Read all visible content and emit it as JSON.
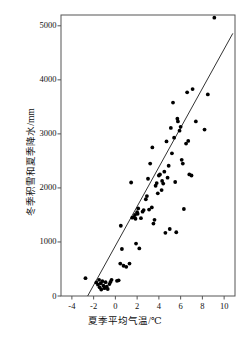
{
  "chart_data": {
    "type": "scatter",
    "title": "",
    "xlabel": "夏季平均气温/℃",
    "ylabel": "冬季积雪和夏季降水/mm",
    "xlim": [
      -5,
      11
    ],
    "ylim": [
      0,
      5200
    ],
    "xticks": [
      -4,
      -2,
      0,
      2,
      4,
      6,
      8,
      10
    ],
    "xticklabels": [
      "-4",
      "-2",
      "0",
      "2",
      "4",
      "6",
      "8",
      "10"
    ],
    "yticks": [
      0,
      1000,
      2000,
      3000,
      4000,
      5000
    ],
    "yticklabels": [
      "0",
      "1000",
      "2000",
      "3000",
      "4000",
      "5000"
    ],
    "grid": false,
    "legend": null,
    "marker": {
      "shape": "circle",
      "color": "#000000",
      "size": 3.2
    },
    "points": [
      {
        "x": -2.75,
        "y": 330
      },
      {
        "x": -1.75,
        "y": 250
      },
      {
        "x": -1.6,
        "y": 210
      },
      {
        "x": -1.5,
        "y": 300
      },
      {
        "x": -1.45,
        "y": 160
      },
      {
        "x": -1.35,
        "y": 235
      },
      {
        "x": -1.3,
        "y": 120
      },
      {
        "x": -1.2,
        "y": 275
      },
      {
        "x": -1.1,
        "y": 190
      },
      {
        "x": -1.0,
        "y": 145
      },
      {
        "x": -0.9,
        "y": 255
      },
      {
        "x": -0.8,
        "y": 175
      },
      {
        "x": -0.7,
        "y": 130
      },
      {
        "x": -0.55,
        "y": 220
      },
      {
        "x": -0.45,
        "y": 260
      },
      {
        "x": -0.35,
        "y": 300
      },
      {
        "x": 0.15,
        "y": 280
      },
      {
        "x": 0.3,
        "y": 290
      },
      {
        "x": 0.45,
        "y": 600
      },
      {
        "x": 0.5,
        "y": 1300
      },
      {
        "x": 0.6,
        "y": 870
      },
      {
        "x": 0.75,
        "y": 560
      },
      {
        "x": 1.0,
        "y": 540
      },
      {
        "x": 1.3,
        "y": 600
      },
      {
        "x": 1.45,
        "y": 2100
      },
      {
        "x": 1.55,
        "y": 1450
      },
      {
        "x": 1.7,
        "y": 1460
      },
      {
        "x": 1.8,
        "y": 1500
      },
      {
        "x": 1.85,
        "y": 1430
      },
      {
        "x": 1.9,
        "y": 970
      },
      {
        "x": 2.0,
        "y": 1550
      },
      {
        "x": 2.05,
        "y": 1520
      },
      {
        "x": 2.1,
        "y": 1620
      },
      {
        "x": 2.2,
        "y": 880
      },
      {
        "x": 2.35,
        "y": 1440
      },
      {
        "x": 2.5,
        "y": 1560
      },
      {
        "x": 2.6,
        "y": 1590
      },
      {
        "x": 2.8,
        "y": 1790
      },
      {
        "x": 2.9,
        "y": 1850
      },
      {
        "x": 3.0,
        "y": 2170
      },
      {
        "x": 3.1,
        "y": 1600
      },
      {
        "x": 3.2,
        "y": 2450
      },
      {
        "x": 3.35,
        "y": 1640
      },
      {
        "x": 3.4,
        "y": 2750
      },
      {
        "x": 3.5,
        "y": 1340
      },
      {
        "x": 3.6,
        "y": 1410
      },
      {
        "x": 3.7,
        "y": 2040
      },
      {
        "x": 3.8,
        "y": 2090
      },
      {
        "x": 3.9,
        "y": 1900
      },
      {
        "x": 4.0,
        "y": 2230
      },
      {
        "x": 4.1,
        "y": 2250
      },
      {
        "x": 4.25,
        "y": 1960
      },
      {
        "x": 4.3,
        "y": 2130
      },
      {
        "x": 4.4,
        "y": 2080
      },
      {
        "x": 4.5,
        "y": 2300
      },
      {
        "x": 4.6,
        "y": 1170
      },
      {
        "x": 4.7,
        "y": 2860
      },
      {
        "x": 4.8,
        "y": 2190
      },
      {
        "x": 4.9,
        "y": 2410
      },
      {
        "x": 5.0,
        "y": 1240
      },
      {
        "x": 5.1,
        "y": 3110
      },
      {
        "x": 5.2,
        "y": 2640
      },
      {
        "x": 5.3,
        "y": 3580
      },
      {
        "x": 5.4,
        "y": 2930
      },
      {
        "x": 5.5,
        "y": 2110
      },
      {
        "x": 5.6,
        "y": 1180
      },
      {
        "x": 5.7,
        "y": 3280
      },
      {
        "x": 5.75,
        "y": 3230
      },
      {
        "x": 5.9,
        "y": 3060
      },
      {
        "x": 6.0,
        "y": 3130
      },
      {
        "x": 6.1,
        "y": 2520
      },
      {
        "x": 6.2,
        "y": 2450
      },
      {
        "x": 6.3,
        "y": 1610
      },
      {
        "x": 6.5,
        "y": 2820
      },
      {
        "x": 6.6,
        "y": 3770
      },
      {
        "x": 6.7,
        "y": 2870
      },
      {
        "x": 6.8,
        "y": 2250
      },
      {
        "x": 7.0,
        "y": 2230
      },
      {
        "x": 7.1,
        "y": 3830
      },
      {
        "x": 7.4,
        "y": 3230
      },
      {
        "x": 8.2,
        "y": 3080
      },
      {
        "x": 8.5,
        "y": 3730
      },
      {
        "x": 9.1,
        "y": 5150
      }
    ],
    "fit_line": {
      "style": "solid",
      "color": "#333333",
      "width": 1.0,
      "x_start": -2.55,
      "y_start": 0,
      "x_end": 10.8,
      "y_end": 4860
    }
  }
}
